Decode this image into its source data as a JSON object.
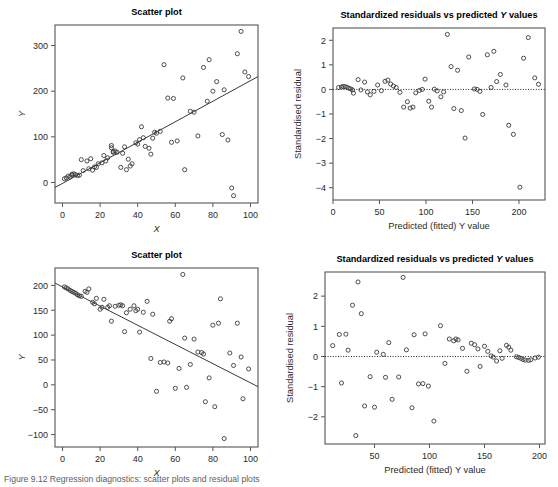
{
  "figure": {
    "width": 558,
    "height": 487,
    "background": "#ffffff",
    "point_color": "#3a3a3a",
    "line_color": "#222222",
    "axis_color": "#555555",
    "caption": "Figure 9.12  Regression diagnostics: scatter plots and residual plots"
  },
  "panels": [
    {
      "id": "top-left",
      "title_plain": "Scatter plot"
    },
    {
      "id": "top-right",
      "title_pre": "Standardized residuals vs predicted ",
      "title_italic": "Y",
      "title_post": " values"
    },
    {
      "id": "bottom-left",
      "title_plain": "Scatter plot"
    },
    {
      "id": "bottom-right",
      "title_pre": "Standardized residuals vs predicted ",
      "title_italic": "Y",
      "title_post": " values"
    }
  ],
  "chart_data": [
    {
      "id": "top-left",
      "type": "scatter",
      "title": "Scatter plot",
      "xlabel": "X",
      "ylabel": "Y",
      "xlim": [
        -4,
        104
      ],
      "ylim": [
        -45,
        345
      ],
      "xticks": [
        0,
        20,
        40,
        60,
        80,
        100
      ],
      "yticks": [
        0,
        100,
        200,
        300
      ],
      "grid": false,
      "legend": null,
      "fit_line": {
        "intercept": -2,
        "slope": 2.25,
        "x_from": -4,
        "x_to": 104
      },
      "points": [
        [
          1,
          8
        ],
        [
          2,
          10
        ],
        [
          3,
          14
        ],
        [
          4,
          12
        ],
        [
          5,
          18
        ],
        [
          5,
          16
        ],
        [
          6,
          19
        ],
        [
          7,
          17
        ],
        [
          8,
          15
        ],
        [
          9,
          16
        ],
        [
          10,
          50
        ],
        [
          11,
          26
        ],
        [
          13,
          47
        ],
        [
          14,
          30
        ],
        [
          15,
          52
        ],
        [
          16,
          27
        ],
        [
          17,
          34
        ],
        [
          18,
          33
        ],
        [
          19,
          41
        ],
        [
          21,
          43
        ],
        [
          22,
          59
        ],
        [
          23,
          47
        ],
        [
          24,
          54
        ],
        [
          26,
          81
        ],
        [
          26,
          76
        ],
        [
          27,
          68
        ],
        [
          27,
          66
        ],
        [
          28,
          69
        ],
        [
          29,
          66
        ],
        [
          31,
          33
        ],
        [
          32,
          64
        ],
        [
          33,
          78
        ],
        [
          34,
          28
        ],
        [
          35,
          51
        ],
        [
          36,
          36
        ],
        [
          37,
          41
        ],
        [
          39,
          87
        ],
        [
          40,
          84
        ],
        [
          41,
          94
        ],
        [
          42,
          122
        ],
        [
          43,
          98
        ],
        [
          44,
          79
        ],
        [
          46,
          75
        ],
        [
          47,
          62
        ],
        [
          48,
          97
        ],
        [
          49,
          110
        ],
        [
          50,
          108
        ],
        [
          52,
          112
        ],
        [
          54,
          258
        ],
        [
          56,
          185
        ],
        [
          58,
          88
        ],
        [
          59,
          184
        ],
        [
          61,
          91
        ],
        [
          64,
          229
        ],
        [
          65,
          28
        ],
        [
          68,
          156
        ],
        [
          70,
          154
        ],
        [
          72,
          102
        ],
        [
          75,
          252
        ],
        [
          77,
          178
        ],
        [
          78,
          269
        ],
        [
          80,
          200
        ],
        [
          82,
          221
        ],
        [
          85,
          105
        ],
        [
          86,
          203
        ],
        [
          88,
          93
        ],
        [
          90,
          -12
        ],
        [
          91,
          -29
        ],
        [
          93,
          282
        ],
        [
          95,
          331
        ],
        [
          97,
          242
        ],
        [
          99,
          232
        ]
      ]
    },
    {
      "id": "top-right",
      "type": "scatter",
      "title": "Standardized residuals vs predicted Y values",
      "xlabel": "Predicted (fitted) Y value",
      "ylabel": "Standardised residual",
      "xlim": [
        0,
        228
      ],
      "ylim": [
        -4.5,
        2.5
      ],
      "xticks": [
        0,
        50,
        100,
        150,
        200
      ],
      "yticks": [
        -4,
        -3,
        -2,
        -1,
        0,
        1,
        2
      ],
      "grid": false,
      "legend": null,
      "zero_reference_line": 0,
      "points": [
        [
          6,
          0.08
        ],
        [
          9,
          0.1
        ],
        [
          11,
          0.12
        ],
        [
          13,
          0.11
        ],
        [
          15,
          0.09
        ],
        [
          17,
          0.05
        ],
        [
          19,
          0.02
        ],
        [
          21,
          -0.02
        ],
        [
          22,
          -0.15
        ],
        [
          27,
          0.4
        ],
        [
          30,
          -0.02
        ],
        [
          34,
          0.3
        ],
        [
          37,
          -0.1
        ],
        [
          40,
          -0.22
        ],
        [
          44,
          -0.08
        ],
        [
          48,
          0.18
        ],
        [
          52,
          -0.05
        ],
        [
          56,
          0.33
        ],
        [
          59,
          0.38
        ],
        [
          62,
          0.22
        ],
        [
          65,
          0.14
        ],
        [
          68,
          0.08
        ],
        [
          72,
          -0.12
        ],
        [
          76,
          -0.72
        ],
        [
          80,
          -0.5
        ],
        [
          83,
          -0.76
        ],
        [
          86,
          -0.72
        ],
        [
          89,
          -0.14
        ],
        [
          93,
          -0.04
        ],
        [
          96,
          0.0
        ],
        [
          99,
          0.42
        ],
        [
          103,
          -0.48
        ],
        [
          106,
          -0.72
        ],
        [
          109,
          0.01
        ],
        [
          112,
          -0.06
        ],
        [
          116,
          -0.3
        ],
        [
          119,
          -0.1
        ],
        [
          123,
          2.24
        ],
        [
          127,
          0.93
        ],
        [
          130,
          -0.78
        ],
        [
          134,
          0.78
        ],
        [
          138,
          -0.86
        ],
        [
          142,
          -1.98
        ],
        [
          146,
          1.32
        ],
        [
          152,
          0.02
        ],
        [
          155,
          0.0
        ],
        [
          158,
          -0.08
        ],
        [
          161,
          -1.02
        ],
        [
          166,
          1.41
        ],
        [
          170,
          0.08
        ],
        [
          173,
          1.55
        ],
        [
          176,
          0.32
        ],
        [
          180,
          0.61
        ],
        [
          186,
          0.18
        ],
        [
          189,
          -1.46
        ],
        [
          194,
          -1.83
        ],
        [
          201,
          -3.98
        ],
        [
          205,
          1.27
        ],
        [
          210,
          2.11
        ],
        [
          217,
          0.47
        ],
        [
          221,
          0.21
        ]
      ]
    },
    {
      "id": "bottom-left",
      "type": "scatter",
      "title": "Scatter plot",
      "xlabel": "X",
      "ylabel": "Y",
      "xlim": [
        -4,
        104
      ],
      "ylim": [
        -125,
        235
      ],
      "xticks": [
        0,
        20,
        40,
        60,
        80,
        100
      ],
      "yticks": [
        -100,
        -50,
        0,
        50,
        100,
        150,
        200
      ],
      "grid": false,
      "legend": null,
      "fit_line": {
        "intercept": 197,
        "slope": -1.93,
        "x_from": -4,
        "x_to": 104
      },
      "points": [
        [
          1,
          197
        ],
        [
          2,
          195
        ],
        [
          3,
          193
        ],
        [
          4,
          190
        ],
        [
          5,
          188
        ],
        [
          6,
          186
        ],
        [
          7,
          184
        ],
        [
          8,
          181
        ],
        [
          9,
          179
        ],
        [
          10,
          178
        ],
        [
          12,
          188
        ],
        [
          13,
          186
        ],
        [
          14,
          193
        ],
        [
          16,
          166
        ],
        [
          17,
          163
        ],
        [
          18,
          174
        ],
        [
          20,
          152
        ],
        [
          21,
          156
        ],
        [
          22,
          172
        ],
        [
          24,
          156
        ],
        [
          25,
          159
        ],
        [
          26,
          128
        ],
        [
          28,
          158
        ],
        [
          30,
          160
        ],
        [
          31,
          161
        ],
        [
          32,
          159
        ],
        [
          33,
          107
        ],
        [
          34,
          145
        ],
        [
          36,
          152
        ],
        [
          38,
          159
        ],
        [
          39,
          149
        ],
        [
          40,
          152
        ],
        [
          41,
          106
        ],
        [
          43,
          146
        ],
        [
          45,
          168
        ],
        [
          47,
          53
        ],
        [
          48,
          142
        ],
        [
          50,
          -13
        ],
        [
          52,
          45
        ],
        [
          54,
          46
        ],
        [
          56,
          44
        ],
        [
          57,
          128
        ],
        [
          58,
          133
        ],
        [
          60,
          -7
        ],
        [
          62,
          33
        ],
        [
          64,
          222
        ],
        [
          65,
          94
        ],
        [
          66,
          -5
        ],
        [
          68,
          41
        ],
        [
          70,
          92
        ],
        [
          72,
          66
        ],
        [
          74,
          65
        ],
        [
          75,
          62
        ],
        [
          76,
          -34
        ],
        [
          78,
          14
        ],
        [
          80,
          120
        ],
        [
          81,
          -44
        ],
        [
          83,
          124
        ],
        [
          84,
          173
        ],
        [
          86,
          -108
        ],
        [
          89,
          64
        ],
        [
          91,
          39
        ],
        [
          93,
          124
        ],
        [
          95,
          56
        ],
        [
          96,
          -28
        ],
        [
          99,
          32
        ]
      ]
    },
    {
      "id": "bottom-right",
      "type": "scatter",
      "title": "Standardized residuals vs predicted Y values",
      "xlabel": "Predicted (fitted) Y value",
      "ylabel": "Standardised residual",
      "xlim": [
        5,
        205
      ],
      "ylim": [
        -2.9,
        2.8
      ],
      "xticks": [
        50,
        100,
        150,
        200
      ],
      "yticks": [
        -2,
        -1,
        0,
        1,
        2
      ],
      "grid": false,
      "legend": null,
      "zero_reference_line": 0,
      "points": [
        [
          12,
          0.36
        ],
        [
          18,
          0.73
        ],
        [
          20,
          -0.88
        ],
        [
          24,
          0.74
        ],
        [
          26,
          0.21
        ],
        [
          30,
          1.7
        ],
        [
          33,
          -2.62
        ],
        [
          35,
          2.47
        ],
        [
          38,
          1.42
        ],
        [
          41,
          -1.64
        ],
        [
          46,
          -0.67
        ],
        [
          50,
          -1.68
        ],
        [
          52,
          0.14
        ],
        [
          58,
          0.07
        ],
        [
          60,
          -0.69
        ],
        [
          63,
          0.46
        ],
        [
          66,
          -1.42
        ],
        [
          72,
          -0.68
        ],
        [
          76,
          2.62
        ],
        [
          79,
          0.22
        ],
        [
          84,
          -1.7
        ],
        [
          86,
          0.72
        ],
        [
          90,
          -0.91
        ],
        [
          94,
          -0.9
        ],
        [
          96,
          0.75
        ],
        [
          99,
          -0.98
        ],
        [
          104,
          -2.14
        ],
        [
          110,
          1.02
        ],
        [
          114,
          -0.23
        ],
        [
          118,
          0.58
        ],
        [
          122,
          0.52
        ],
        [
          124,
          0.58
        ],
        [
          126,
          0.55
        ],
        [
          130,
          0.27
        ],
        [
          134,
          -0.49
        ],
        [
          138,
          0.44
        ],
        [
          141,
          0.39
        ],
        [
          144,
          0.25
        ],
        [
          146,
          -0.33
        ],
        [
          150,
          0.34
        ],
        [
          153,
          0.17
        ],
        [
          156,
          0.02
        ],
        [
          158,
          -0.02
        ],
        [
          161,
          -0.15
        ],
        [
          164,
          0.19
        ],
        [
          166,
          -0.06
        ],
        [
          170,
          0.37
        ],
        [
          172,
          0.31
        ],
        [
          174,
          0.21
        ],
        [
          179,
          -0.01
        ],
        [
          181,
          -0.03
        ],
        [
          183,
          -0.06
        ],
        [
          185,
          -0.1
        ],
        [
          187,
          -0.12
        ],
        [
          190,
          -0.13
        ],
        [
          192,
          -0.11
        ],
        [
          196,
          -0.05
        ],
        [
          199,
          -0.02
        ]
      ]
    }
  ]
}
